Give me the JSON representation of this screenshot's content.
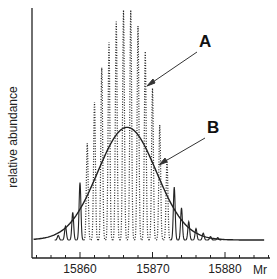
{
  "chart_data": {
    "type": "line",
    "title": "",
    "xlabel": "Mr",
    "ylabel": "relative abundance",
    "xlim": [
      15853.3,
      15886
    ],
    "ylim": [
      0,
      1
    ],
    "grid": false,
    "x_ticks_major": [
      15860,
      15870,
      15880
    ],
    "x_ticks_major_labels": [
      "15860",
      "15870",
      "15880"
    ],
    "x_ticks_minor_step": 2,
    "series": [
      {
        "name": "A",
        "style": "dotted",
        "description": "resolved isotopic distribution (individual isotope peaks, 1 Da spacing)",
        "x": [
          15857,
          15858,
          15859,
          15860,
          15861,
          15862,
          15863,
          15864,
          15865,
          15866,
          15867,
          15868,
          15869,
          15870,
          15871,
          15872,
          15873,
          15874,
          15875,
          15876,
          15877,
          15878,
          15879
        ],
        "values": [
          0.02,
          0.06,
          0.12,
          0.25,
          0.42,
          0.6,
          0.75,
          0.86,
          0.95,
          1.0,
          1.0,
          0.93,
          0.82,
          0.66,
          0.5,
          0.35,
          0.23,
          0.14,
          0.08,
          0.05,
          0.03,
          0.015,
          0.01
        ]
      },
      {
        "name": "B",
        "style": "solid",
        "description": "unresolved envelope (average mass profile)",
        "peak_x": 15866.5,
        "peak_value": 0.49,
        "fwhm": 9.5
      }
    ],
    "annotations": [
      {
        "label": "A",
        "arrow_to_series": "A"
      },
      {
        "label": "B",
        "arrow_to_series": "B"
      }
    ]
  },
  "labels": {
    "ylabel": "relative abundance",
    "xlabel": "Mr",
    "tick_15860": "15860",
    "tick_15870": "15870",
    "tick_15880": "15880",
    "annot_a": "A",
    "annot_b": "B"
  }
}
